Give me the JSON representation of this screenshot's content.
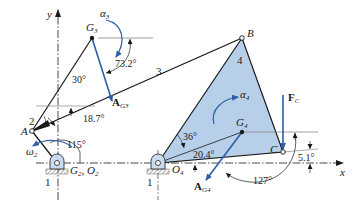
{
  "diagram": {
    "type": "four-bar linkage acceleration analysis",
    "colors": {
      "link": "#1a1a1a",
      "vector": "#2a5fa8",
      "link4_fill": "#b7cfe9",
      "ground_hatch": "#8a8a8a",
      "pin_fill": "#c9dcef"
    },
    "axes": {
      "x_label": "x",
      "y_label": "y"
    },
    "points": {
      "A": "A",
      "B": "B",
      "C": "C",
      "G3": "G",
      "G3_sub": "3",
      "G4": "G",
      "G4_sub": "4",
      "O4": "O",
      "O4_sub": "4",
      "G2O2": "G",
      "G2_sub": "2",
      "O2": "O",
      "O2_sub": "2"
    },
    "links": {
      "ground_left": "1",
      "ground_right": "1",
      "crank": "2",
      "coupler": "3",
      "rocker": "4"
    },
    "angles": {
      "crank_angle": "115°",
      "coupler_angle": "18.7°",
      "g3_offset": "30°",
      "ag3_angle": "73.2°",
      "g4_offset": "36°",
      "g4_line_angle": "20.4°",
      "ag4_angle": "127°",
      "c_angle": "5.1°"
    },
    "vectors": {
      "AG3": "A",
      "AG3_sub": "G3",
      "AG4": "A",
      "AG4_sub": "G4",
      "FC": "F",
      "FC_sub": "C"
    },
    "kinematics": {
      "omega2": "ω",
      "omega2_sub": "2",
      "alpha3": "α",
      "alpha3_sub": "3",
      "alpha4": "α",
      "alpha4_sub": "4"
    }
  }
}
